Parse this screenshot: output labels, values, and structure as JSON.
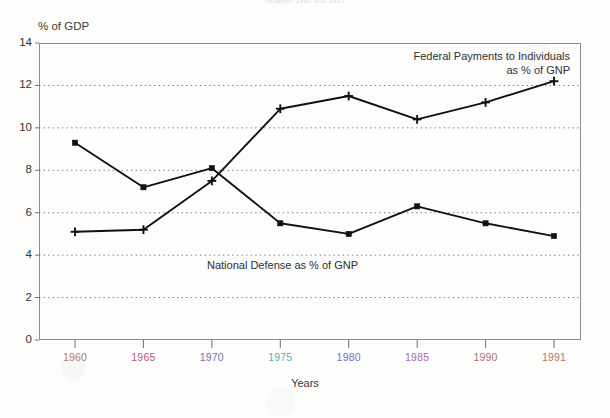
{
  "top_clipped_caption": "between 1960 and 1991",
  "axes": {
    "y_title": "% of GDP",
    "x_title": "Years"
  },
  "chart_data": {
    "type": "line",
    "title": "",
    "xlabel": "Years",
    "ylabel": "% of GDP",
    "ylim": [
      0,
      14
    ],
    "ytick_step": 2,
    "grid": true,
    "grid_style": "dotted-horizontal",
    "legend_position": "inline-annotations",
    "categories": [
      "1960",
      "1965",
      "1970",
      "1975",
      "1980",
      "1985",
      "1990",
      "1991"
    ],
    "yticks": [
      "0",
      "2",
      "4",
      "6",
      "8",
      "10",
      "12",
      "14"
    ],
    "series": [
      {
        "name": "Federal Payments to Individuals as % of GNP",
        "marker": "plus",
        "color": "#111111",
        "values": [
          5.1,
          5.2,
          7.5,
          10.9,
          11.5,
          10.4,
          11.2,
          12.2
        ]
      },
      {
        "name": "National Defense as % of GNP",
        "marker": "square",
        "color": "#111111",
        "values": [
          9.3,
          7.2,
          8.1,
          5.5,
          5.0,
          6.3,
          5.5,
          4.9
        ]
      }
    ],
    "annotations": [
      {
        "id": "federal-payments",
        "text_line1": "Federal Payments to Individuals",
        "text_line2": "as % of GNP"
      },
      {
        "id": "national-defense",
        "text_line1": "National Defense as % of GNP",
        "text_line2": ""
      }
    ]
  },
  "x_tick_colors": [
    "#b5766a",
    "#b05a86",
    "#6f74b5",
    "#56b0c4",
    "#6f74b5",
    "#a86aa8",
    "#b0707a",
    "#b5766a"
  ]
}
